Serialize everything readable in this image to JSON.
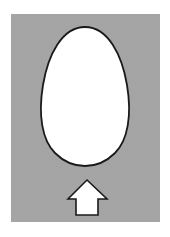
{
  "figure": {
    "background": {
      "color": "#d4d4d4",
      "pattern": "stipple-dots",
      "dot_color": "#8a8a8a"
    },
    "egg": {
      "fill": "#ffffff",
      "stroke": "#1a1a1a",
      "orientation": "narrow-end-up"
    },
    "arrow": {
      "icon": "arrow-up-icon",
      "fill": "#ffffff",
      "stroke": "#1a1a1a",
      "direction": "up"
    }
  }
}
